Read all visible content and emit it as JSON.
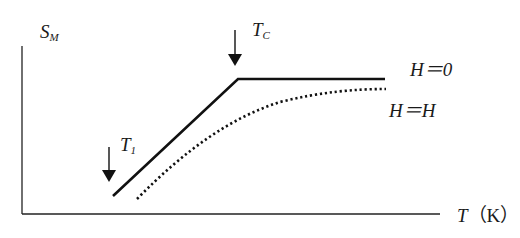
{
  "diagram": {
    "y_axis": {
      "symbol": "S",
      "subscript": "M"
    },
    "x_axis": {
      "symbol": "T",
      "unit": "（K）"
    },
    "markers": [
      {
        "symbol": "T",
        "subscript": "C"
      },
      {
        "symbol": "T",
        "subscript": "1"
      }
    ],
    "curves": [
      {
        "label": "H＝0",
        "style": "solid"
      },
      {
        "label": "H＝H",
        "style": "dotted"
      }
    ],
    "colors": {
      "line": "#111111",
      "background": "#ffffff"
    }
  }
}
